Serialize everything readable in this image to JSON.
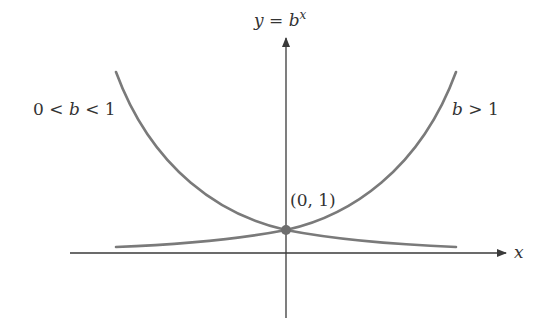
{
  "diagram": {
    "title_label": {
      "lhs": "y",
      "eq": " = ",
      "base": "b",
      "exp": "x"
    },
    "x_axis_label": "x",
    "left_curve_label": "0 < b < 1",
    "right_curve_label": "b > 1",
    "point_label": "(0, 1)",
    "colors": {
      "curve": "#7a7a7a",
      "axis": "#3a3a3a",
      "point": "#6e6e6e",
      "text": "#333333"
    }
  }
}
